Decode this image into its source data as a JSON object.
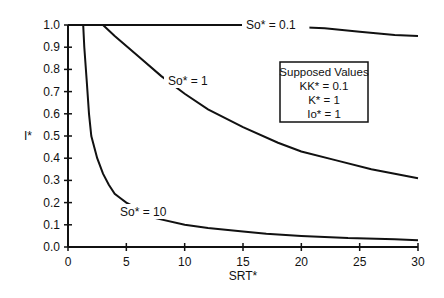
{
  "chart_data": {
    "type": "line",
    "title": "",
    "xlabel": "SRT*",
    "ylabel": "I*",
    "xlim": [
      0,
      30
    ],
    "ylim": [
      0,
      1.0
    ],
    "xticks": [
      0,
      5,
      10,
      15,
      20,
      25,
      30
    ],
    "yticks": [
      "0.0",
      "0.1",
      "0.2",
      "0.3",
      "0.4",
      "0.5",
      "0.6",
      "0.7",
      "0.8",
      "0.9",
      "1.0"
    ],
    "grid": false,
    "series": [
      {
        "name": "So* = 0.1",
        "x": [
          0,
          10,
          18,
          20,
          22,
          25,
          28,
          30
        ],
        "y": [
          1.0,
          1.0,
          1.0,
          0.99,
          0.985,
          0.97,
          0.955,
          0.95
        ]
      },
      {
        "name": "So* = 1",
        "x": [
          3,
          4,
          6,
          8,
          10,
          12,
          15,
          18,
          20,
          23,
          26,
          28,
          30
        ],
        "y": [
          1.0,
          0.95,
          0.86,
          0.77,
          0.69,
          0.62,
          0.54,
          0.47,
          0.43,
          0.39,
          0.35,
          0.33,
          0.31
        ]
      },
      {
        "name": "So* = 10",
        "x": [
          1.3,
          1.4,
          1.6,
          1.8,
          2.0,
          2.5,
          3,
          3.5,
          4,
          4.5,
          5,
          7.5,
          10,
          12,
          15,
          17,
          20,
          24,
          28,
          30
        ],
        "y": [
          1.0,
          0.9,
          0.75,
          0.6,
          0.5,
          0.4,
          0.33,
          0.28,
          0.24,
          0.22,
          0.2,
          0.13,
          0.1,
          0.085,
          0.07,
          0.06,
          0.05,
          0.04,
          0.035,
          0.03
        ]
      }
    ],
    "annotations": [
      "So* = 0.1",
      "So* = 1",
      "So* = 10"
    ],
    "legend": {
      "title": "Supposed Values",
      "entries": [
        "KK* = 0.1",
        "K* = 1",
        "Io* = 1"
      ]
    }
  }
}
